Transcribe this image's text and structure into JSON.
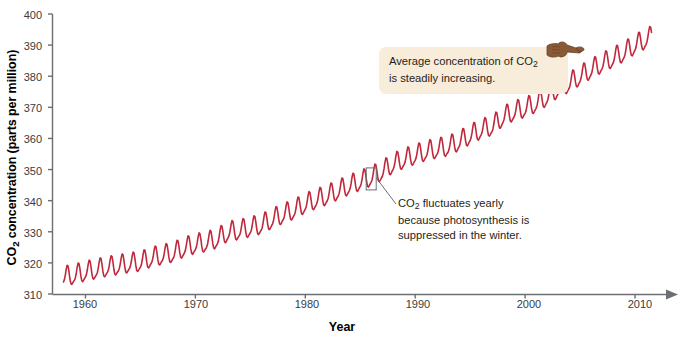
{
  "chart_data": {
    "type": "line",
    "title": "",
    "xlabel": "Year",
    "ylabel": "CO2 concentration (parts per million)",
    "ylabel_rich": {
      "pre": "CO",
      "sub": "2",
      "post": " concentration (parts per million)"
    },
    "xlim": [
      1957,
      2013
    ],
    "ylim": [
      310,
      400
    ],
    "yticks": [
      310,
      320,
      330,
      340,
      350,
      360,
      370,
      380,
      390,
      400
    ],
    "xticks": [
      1960,
      1970,
      1980,
      1990,
      2000,
      2010
    ],
    "grid": false,
    "legend": null,
    "series": [
      {
        "name": "Atmospheric CO2 concentration (Mauna Loa)",
        "color": "#c0283c",
        "line_width": 1.6,
        "description": "Annual sawtooth oscillation of about +/- 3 ppm superimposed on a steadily accelerating rising trend.",
        "seasonal_amplitude_ppm": 3.0,
        "seasonal_peak_month": 5,
        "seasonal_trough_month": 10,
        "x": [
          1958,
          1959,
          1960,
          1961,
          1962,
          1963,
          1964,
          1965,
          1966,
          1967,
          1968,
          1969,
          1970,
          1971,
          1972,
          1973,
          1974,
          1975,
          1976,
          1977,
          1978,
          1979,
          1980,
          1981,
          1982,
          1983,
          1984,
          1985,
          1986,
          1987,
          1988,
          1989,
          1990,
          1991,
          1992,
          1993,
          1994,
          1995,
          1996,
          1997,
          1998,
          1999,
          2000,
          2001,
          2002,
          2003,
          2004,
          2005,
          2006,
          2007,
          2008,
          2009,
          2010,
          2011
        ],
        "values": [
          315.3,
          315.9,
          316.9,
          317.6,
          318.4,
          318.9,
          319.6,
          320.0,
          321.4,
          322.2,
          323.0,
          324.6,
          325.7,
          326.3,
          327.5,
          329.7,
          330.2,
          331.1,
          332.0,
          333.8,
          335.4,
          336.8,
          338.7,
          340.1,
          341.4,
          343.0,
          344.6,
          346.0,
          347.4,
          349.2,
          351.6,
          353.1,
          354.4,
          355.6,
          356.4,
          357.1,
          358.8,
          360.8,
          362.6,
          363.7,
          366.7,
          368.4,
          369.5,
          371.1,
          373.2,
          375.8,
          377.5,
          379.8,
          381.9,
          383.8,
          385.6,
          387.4,
          389.8,
          391.6
        ]
      }
    ],
    "annotations": [
      {
        "name": "average-increasing",
        "text_lines": [
          "Average concentration of CO2",
          "is steadily increasing."
        ],
        "rich": {
          "line1_pre": "Average concentration of CO",
          "line1_sub": "2",
          "line2": "is steadily increasing."
        },
        "style": "rounded-box",
        "background": "#f8ecda",
        "icon": "pointing-hand-icon"
      },
      {
        "name": "yearly-fluctuation",
        "text_lines": [
          "CO2 fluctuates yearly",
          "because photosynthesis is",
          "suppressed in the winter."
        ],
        "rich": {
          "line1_pre": "CO",
          "line1_sub": "2",
          "line1_post": " fluctuates yearly",
          "line2": "because photosynthesis is",
          "line3": "suppressed in the winter."
        },
        "style": "leader-line",
        "target_year": 1986,
        "target_value": 347
      }
    ]
  },
  "axis": {
    "color": "#6b6f73",
    "x_arrowhead": true,
    "ytick_labels": [
      "400",
      "390",
      "380",
      "370",
      "360",
      "350",
      "340",
      "330",
      "320",
      "310"
    ],
    "xtick_labels": [
      "1960",
      "1970",
      "1980",
      "1990",
      "2000",
      "2010"
    ]
  },
  "colors": {
    "series": "#c0283c",
    "callout_bg": "#f8ecda",
    "axis": "#6b6f73",
    "text": "#231f20",
    "tick_text": "#3b3b3b",
    "leader": "#6b6f73",
    "background": "#ffffff"
  }
}
